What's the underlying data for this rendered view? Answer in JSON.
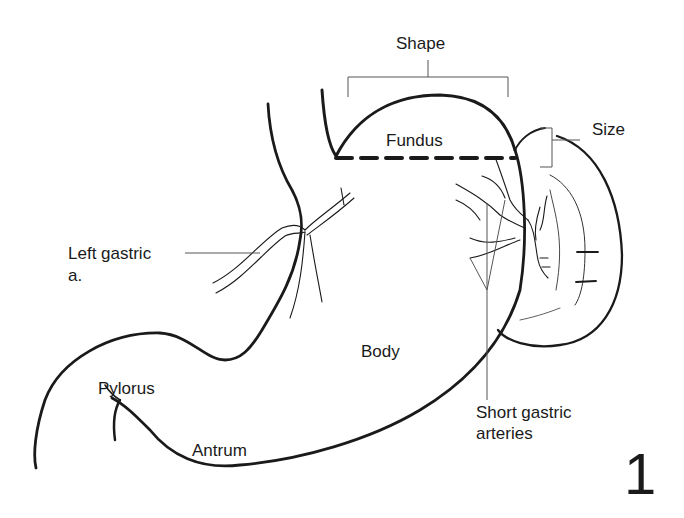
{
  "diagram": {
    "figure_number": "1",
    "labels": {
      "shape": "Shape",
      "size": "Size",
      "fundus": "Fundus",
      "left_gastric_line1": "Left gastric",
      "left_gastric_line2": "a.",
      "body": "Body",
      "pylorus": "Pylorus",
      "antrum": "Antrum",
      "short_gastric_line1": "Short gastric",
      "short_gastric_line2": "arteries"
    },
    "colors": {
      "stroke": "#1a1a1a",
      "leader": "#555555",
      "background": "#ffffff"
    }
  }
}
